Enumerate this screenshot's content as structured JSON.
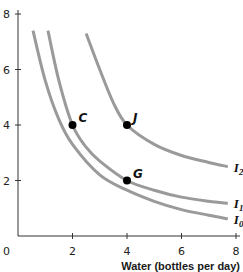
{
  "chart_data": {
    "type": "line",
    "title": "",
    "xlabel": "Water (bottles per day)",
    "ylabel": "",
    "xlim": [
      0,
      8
    ],
    "ylim": [
      0,
      8
    ],
    "x_ticks": [
      "2",
      "4",
      "6",
      "8"
    ],
    "y_ticks": [
      "2",
      "4",
      "6",
      "8"
    ],
    "origin_label": "0",
    "grid": false,
    "legend": "none (curves labeled at right end)",
    "series": [
      {
        "name": "I0",
        "label_main": "I",
        "label_sub": "0",
        "color": "#9a9a9a",
        "points": [
          [
            0.55,
            7.4
          ],
          [
            1.0,
            5.6
          ],
          [
            1.5,
            4.2
          ],
          [
            2.0,
            3.3
          ],
          [
            3.0,
            2.2
          ],
          [
            4.0,
            1.65
          ],
          [
            5.0,
            1.25
          ],
          [
            6.0,
            0.95
          ],
          [
            7.0,
            0.75
          ],
          [
            7.7,
            0.62
          ]
        ]
      },
      {
        "name": "I1",
        "label_main": "I",
        "label_sub": "1",
        "color": "#9a9a9a",
        "points": [
          [
            1.1,
            7.4
          ],
          [
            1.5,
            5.6
          ],
          [
            2.0,
            4.0
          ],
          [
            2.5,
            3.2
          ],
          [
            3.0,
            2.7
          ],
          [
            4.0,
            2.0
          ],
          [
            5.0,
            1.65
          ],
          [
            6.0,
            1.4
          ],
          [
            7.0,
            1.25
          ],
          [
            7.7,
            1.18
          ]
        ]
      },
      {
        "name": "I2",
        "label_main": "I",
        "label_sub": "2",
        "color": "#9a9a9a",
        "points": [
          [
            2.5,
            7.3
          ],
          [
            3.0,
            6.0
          ],
          [
            3.5,
            4.8
          ],
          [
            4.0,
            4.0
          ],
          [
            5.0,
            3.3
          ],
          [
            6.0,
            2.9
          ],
          [
            7.0,
            2.65
          ],
          [
            7.7,
            2.5
          ]
        ]
      }
    ],
    "points": [
      {
        "label": "C",
        "x": 2,
        "y": 4
      },
      {
        "label": "J",
        "x": 4,
        "y": 4
      },
      {
        "label": "G",
        "x": 4,
        "y": 2
      }
    ]
  }
}
